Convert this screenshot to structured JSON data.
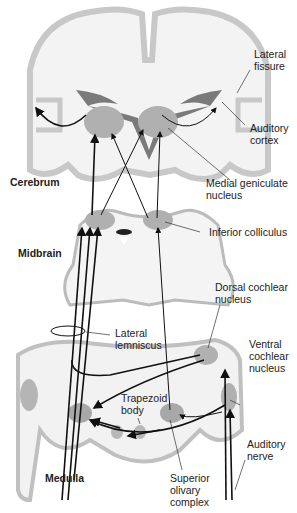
{
  "diagram": {
    "regions": {
      "cerebrum": "Cerebrum",
      "midbrain": "Midbrain",
      "medulla": "Medulla"
    },
    "labels": {
      "lateral_fissure": "Lateral\nfissure",
      "auditory_cortex": "Auditory\ncortex",
      "medial_geniculate": "Medial geniculate\nnucleus",
      "inferior_colliculus": "Inferior colliculus",
      "dorsal_cochlear": "Dorsal cochlear\nnucleus",
      "lateral_lemniscus": "Lateral\nlemniscus",
      "ventral_cochlear": "Ventral\ncochlear\nnucleus",
      "trapezoid_body": "Trapezoid\nbody",
      "auditory_nerve": "Auditory\nnerve",
      "superior_olivary": "Superior\nolivary\ncomplex"
    },
    "colors": {
      "tissue_light": "#f2f2f2",
      "cortex_gray": "#c8c8c8",
      "nucleus_gray": "#a8a8a8",
      "ventricle_dark": "#7a7a7a",
      "pathway": "#111111"
    }
  }
}
